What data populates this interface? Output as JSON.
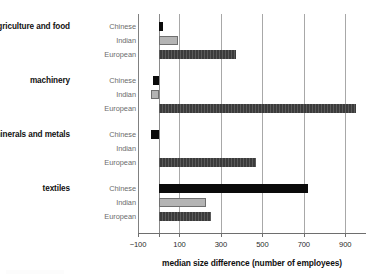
{
  "chart_data": {
    "type": "bar",
    "orientation": "horizontal",
    "title": "",
    "xlabel": "median size difference (number of employees)",
    "ylabel": "",
    "xlim": [
      -100,
      1000
    ],
    "xticks": [
      -100,
      100,
      300,
      500,
      700,
      900
    ],
    "xticklabels": [
      "−100",
      "100",
      "300",
      "500",
      "700",
      "900"
    ],
    "grid": "vertical",
    "legend": "none",
    "zero_reference": 0,
    "categories": [
      "agriculture and food",
      "machinery",
      "minerals and metals",
      "textiles"
    ],
    "series": [
      {
        "name": "Chinese",
        "color": "#0b0b0b",
        "values": [
          20,
          -30,
          -35,
          720
        ]
      },
      {
        "name": "Indian",
        "color": "#b4b4b4",
        "values": [
          95,
          -35,
          0,
          230
        ]
      },
      {
        "name": "European",
        "color": "#3b3b3b",
        "values": [
          375,
          950,
          470,
          250
        ]
      }
    ],
    "groups": [
      {
        "label": "agriculture and food",
        "bars": [
          {
            "series": "Chinese",
            "value": 20
          },
          {
            "series": "Indian",
            "value": 95
          },
          {
            "series": "European",
            "value": 375
          }
        ]
      },
      {
        "label": "machinery",
        "bars": [
          {
            "series": "Chinese",
            "value": -30
          },
          {
            "series": "Indian",
            "value": -35
          },
          {
            "series": "European",
            "value": 950
          }
        ]
      },
      {
        "label": "minerals and metals",
        "bars": [
          {
            "series": "Chinese",
            "value": -35
          },
          {
            "series": "Indian",
            "value": 0
          },
          {
            "series": "European",
            "value": 470
          }
        ]
      },
      {
        "label": "textiles",
        "bars": [
          {
            "series": "Chinese",
            "value": 720
          },
          {
            "series": "Indian",
            "value": 230
          },
          {
            "series": "European",
            "value": 250
          }
        ]
      }
    ]
  },
  "axis": {
    "title": "median size difference (number of employees)",
    "tick_labels": [
      "−100",
      "100",
      "300",
      "500",
      "700",
      "900"
    ]
  },
  "groups": {
    "g0": {
      "label": "agriculture and food"
    },
    "g1": {
      "label": "machinery"
    },
    "g2": {
      "label": "minerals and metals"
    },
    "g3": {
      "label": "textiles"
    }
  },
  "series_names": {
    "chinese": "Chinese",
    "indian": "Indian",
    "european": "European"
  },
  "colors": {
    "chinese": "#0b0b0b",
    "indian": "#b4b4b4",
    "european": "#3b3b3b",
    "grid": "#a8a8a8",
    "axis": "#6e6e6e",
    "series_label": "#6b6b6b",
    "group_label": "#111111"
  }
}
